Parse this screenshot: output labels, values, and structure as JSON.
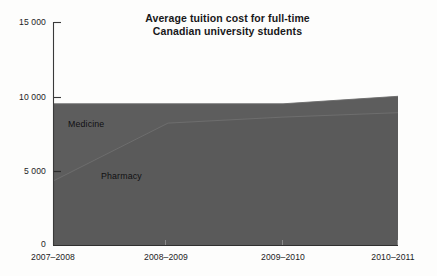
{
  "chart_data": {
    "type": "area",
    "title": "Average tuition cost for full-time Canadian university students",
    "title_line1": "Average tuition cost for full-time",
    "title_line2": "Canadian university students",
    "xlabel": "",
    "ylabel": "",
    "stacked": false,
    "grid": false,
    "legend_position": "inline-labels",
    "categories": [
      "2007–2008",
      "2008–2009",
      "2009–2010",
      "2010–2011"
    ],
    "x": [
      0,
      1,
      2,
      3
    ],
    "ylim": [
      0,
      15000
    ],
    "xlim": [
      0,
      3
    ],
    "y_ticks": [
      0,
      5000,
      10000,
      15000
    ],
    "y_tick_labels": [
      "0",
      "5 000",
      "10 000",
      "15 000"
    ],
    "x_tick_labels": [
      "2007–2008",
      "2008–2009",
      "2009–2010",
      "2010–2011"
    ],
    "series": [
      {
        "name": "Medicine",
        "values": [
          9500,
          9500,
          9500,
          10000
        ],
        "color": "#5d5d5d",
        "label_text": "Medicine"
      },
      {
        "name": "Pharmacy",
        "values": [
          4300,
          8200,
          8600,
          8900
        ],
        "color": "#5a5a5a",
        "label_text": "Pharmacy"
      }
    ],
    "colors": {
      "area_fill": "#5d5d5d",
      "area_fill_lower": "#585858",
      "axis": "#3a3a3a",
      "text": "#1c1c1e",
      "background": "#fdfdfc"
    }
  },
  "axes": {
    "y_labels": [
      {
        "text": "15 000",
        "value": 15000
      },
      {
        "text": "10 000",
        "value": 10000
      },
      {
        "text": "5 000",
        "value": 5000
      },
      {
        "text": "0",
        "value": 0
      }
    ],
    "x_labels": [
      {
        "text": "2007–2008",
        "value": 0
      },
      {
        "text": "2008–2009",
        "value": 1
      },
      {
        "text": "2009–2010",
        "value": 2
      },
      {
        "text": "2010–2011",
        "value": 3
      }
    ]
  },
  "title": {
    "line1": "Average tuition cost for full-time",
    "line2": "Canadian university students"
  },
  "series_labels": {
    "medicine": "Medicine",
    "pharmacy": "Pharmacy"
  }
}
